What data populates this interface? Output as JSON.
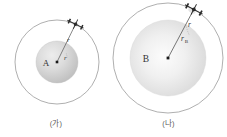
{
  "figure": {
    "background_color": "#ffffff",
    "orbit_stroke_color": "#8c8c8c",
    "planet_fill_light": "#fbfbfb",
    "planet_fill_dark": "#c9c9c9",
    "label_color": "#333333",
    "caption_color": "#595959",
    "satellite_color": "#2b2b2b",
    "center_dot_color": "#1a1a1a",
    "radius_line_color": "#555555"
  },
  "panels": [
    {
      "id": "panel-a",
      "caption": "(가)",
      "planet_label": "A",
      "planet_radius_label": "r",
      "planet_radius_subscript": "A",
      "orbit_radius_label": "r",
      "satellite_name": "satellite-icon",
      "planet_center_x": 57,
      "planet_center_y": 62,
      "planet_radius_px": 21,
      "orbit_radius_px": 42,
      "satellite_angle_deg": -64
    },
    {
      "id": "panel-b",
      "caption": "(나)",
      "planet_label": "B",
      "planet_radius_label": "r",
      "planet_radius_subscript": "B",
      "orbit_radius_label": "r",
      "satellite_name": "satellite-icon",
      "planet_center_x": 168,
      "planet_center_y": 58,
      "planet_radius_px": 38,
      "orbit_radius_px": 55,
      "satellite_angle_deg": -62
    }
  ]
}
